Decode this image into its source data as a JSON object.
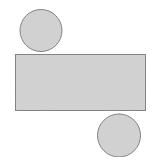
{
  "figure": {
    "background_color": "#ffffff",
    "width": 152,
    "height": 168,
    "fill_color": "#d2d2d2",
    "stroke_color": "#7f7f7f",
    "stroke_width": 1,
    "shapes": [
      {
        "name": "top-left-circle",
        "type": "circle",
        "cx": 41,
        "cy": 30.5,
        "r": 21.5,
        "fill": "#d2d2d2",
        "stroke": "#7f7f7f"
      },
      {
        "name": "center-rectangle",
        "type": "rect",
        "x": 15,
        "y": 54,
        "width": 131,
        "height": 57,
        "fill": "#d2d2d2",
        "stroke": "#7f7f7f"
      },
      {
        "name": "bottom-right-circle",
        "type": "circle",
        "cx": 119,
        "cy": 135.5,
        "r": 22,
        "fill": "#d2d2d2",
        "stroke": "#7f7f7f"
      }
    ]
  }
}
